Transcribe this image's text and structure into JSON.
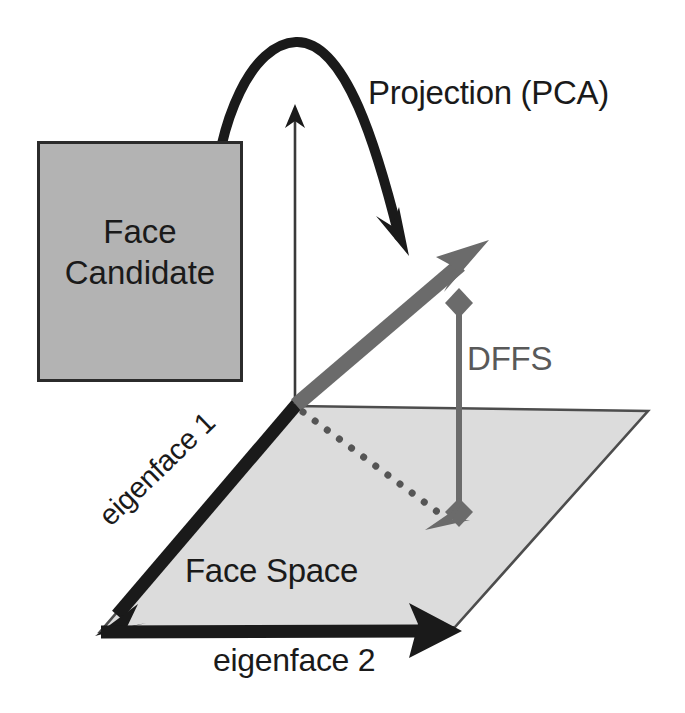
{
  "figure": {
    "background_color": "#ffffff"
  },
  "labels": {
    "projection": "Projection (PCA)",
    "dffs": "DFFS",
    "face_space": "Face Space",
    "eigenface_1": "eigenface 1",
    "eigenface_2": "eigenface 2"
  },
  "face_candidate": {
    "line1": "Face",
    "line2": "Candidate",
    "fill_color": "#b3b3b3",
    "border_color": "#2b2b2b"
  },
  "colors": {
    "black": "#1a1a1a",
    "dark_outline": "#2b2b2b",
    "gray_vector": "#6b6b6b",
    "dffs_gray": "#595959",
    "plane_fill": "#dcdcdc",
    "plane_edge": "#4d4d4d",
    "box_fill": "#b3b3b3"
  },
  "geometry": {
    "origin": [
      295,
      405
    ],
    "plane_corners": [
      [
        295,
        406
      ],
      [
        648,
        411
      ],
      [
        455,
        627
      ],
      [
        100,
        632
      ]
    ],
    "projection_vector_tip": [
      487,
      242
    ],
    "dffs_top": [
      459,
      300
    ],
    "dffs_bottom": [
      459,
      518
    ],
    "curve_start": [
      213,
      208
    ],
    "curve_peak": [
      295,
      42
    ],
    "curve_tip": [
      407,
      253
    ],
    "axis_arrow_tip": [
      295,
      106
    ],
    "eigenface1_arrow_tip": [
      100,
      632
    ],
    "eigenface2_arrow_tip": [
      458,
      631
    ]
  }
}
